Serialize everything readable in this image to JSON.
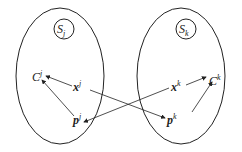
{
  "diagram": {
    "left_set": {
      "label": "S",
      "sub": "j",
      "center_node": "C",
      "center_sup": "j",
      "x_node": "x",
      "x_sup": "j",
      "p_node": "p",
      "p_sup": "j"
    },
    "right_set": {
      "label": "S",
      "sub": "k",
      "center_node": "C",
      "center_sup": "k",
      "x_node": "x",
      "x_sup": "k",
      "p_node": "p",
      "p_sup": "k"
    },
    "edges": [
      {
        "from": "x^j",
        "to": "C^j"
      },
      {
        "from": "p^j",
        "to": "C^j"
      },
      {
        "from": "x^j",
        "to": "p^k"
      },
      {
        "from": "x^k",
        "to": "p^j"
      },
      {
        "from": "x^k",
        "to": "C^k"
      },
      {
        "from": "p^k",
        "to": "C^k"
      }
    ],
    "colors": {
      "stroke": "#222222",
      "background": "#ffffff"
    }
  }
}
